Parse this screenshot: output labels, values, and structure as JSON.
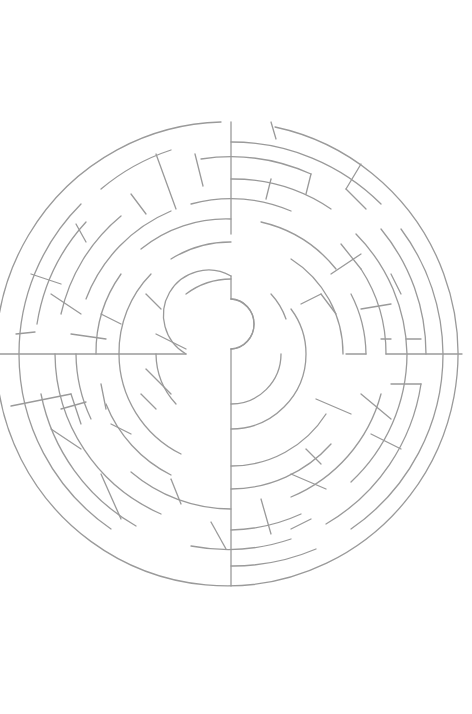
{
  "puzzle": {
    "type": "circular-maze",
    "start_label": "Running cook",
    "goal_label": "Oven with cake",
    "maze": {
      "center": [
        231,
        354
      ],
      "outer_radius": 230,
      "stroke_color": "#9a9a9a",
      "background": "#ffffff"
    },
    "start_icon": "running-woman-icon",
    "goal_icon": "oven-cake-icon"
  }
}
